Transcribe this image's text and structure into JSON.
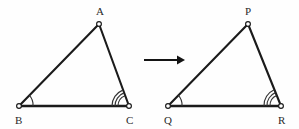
{
  "figure": {
    "background_color": "#fefefe",
    "stroke_color": "#1b1b1b",
    "label_color": "#2a2a2a",
    "arc_color": "#333333"
  },
  "triangles": [
    {
      "name": "triangle-abc",
      "vertices": [
        {
          "label": "A",
          "x": 99,
          "y": 24,
          "label_x": 96,
          "label_y": 15
        },
        {
          "label": "B",
          "x": 19,
          "y": 106,
          "label_x": 15,
          "label_y": 124
        },
        {
          "label": "C",
          "x": 129,
          "y": 106,
          "label_x": 126,
          "label_y": 124
        }
      ],
      "angle_marks": [
        {
          "vertex": "B",
          "arcs": 1
        },
        {
          "vertex": "C",
          "arcs": 3
        }
      ]
    },
    {
      "name": "triangle-pqr",
      "vertices": [
        {
          "label": "P",
          "x": 248,
          "y": 24,
          "label_x": 245,
          "label_y": 15
        },
        {
          "label": "Q",
          "x": 168,
          "y": 106,
          "label_x": 164,
          "label_y": 124
        },
        {
          "label": "R",
          "x": 281,
          "y": 106,
          "label_x": 278,
          "label_y": 124
        }
      ],
      "angle_marks": [
        {
          "vertex": "Q",
          "arcs": 1
        },
        {
          "vertex": "R",
          "arcs": 3
        }
      ]
    }
  ],
  "arrow": {
    "name": "transformation-arrow",
    "x1": 144,
    "y1": 60,
    "x2": 184,
    "y2": 60,
    "direction": "right"
  }
}
